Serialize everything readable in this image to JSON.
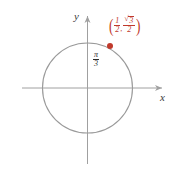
{
  "figure": {
    "type": "unit-circle-diagram"
  },
  "axes": {
    "y_label": "y",
    "x_label": "x",
    "color": "#a0a0a0"
  },
  "circle": {
    "center_px": [
      87.5,
      88
    ],
    "radius_px": 45,
    "color": "#9a9a9a",
    "fill": "none"
  },
  "angle": {
    "label_numerator": "π",
    "label_denominator": "3",
    "color": "#2b2b2b",
    "value_degrees": 60
  },
  "point": {
    "color": "#c0392b",
    "center_px": [
      110,
      46
    ],
    "radius_px": 3
  },
  "coordinate_label": {
    "open_paren": "(",
    "close_paren": ")",
    "comma": ",",
    "x_numerator": "1",
    "x_denominator": "2",
    "y_radical_sign": "√",
    "y_radicand": "3",
    "y_denominator": "2",
    "color": "#c0392b"
  },
  "chart_data": {
    "type": "scatter",
    "title": "",
    "xlabel": "x",
    "ylabel": "y",
    "xlim": [
      -1.45,
      1.72
    ],
    "ylim": [
      -1.65,
      1.62
    ],
    "grid": false,
    "legend": null,
    "series": [
      {
        "name": "terminal point",
        "x": [
          0.5
        ],
        "y": [
          0.866
        ],
        "labels": [
          "(1/2, √3/2)"
        ],
        "color": "#c0392b"
      }
    ],
    "shapes": [
      {
        "type": "circle",
        "name": "unit circle",
        "cx": 0,
        "cy": 0,
        "r": 1,
        "color": "#9a9a9a"
      }
    ],
    "annotations": [
      {
        "text": "π/3",
        "x": 0.22,
        "y": 0.66,
        "color": "#2b2b2b"
      },
      {
        "text": "(1/2, √3/2)",
        "x": 0.62,
        "y": 1.45,
        "color": "#c0392b"
      }
    ]
  }
}
